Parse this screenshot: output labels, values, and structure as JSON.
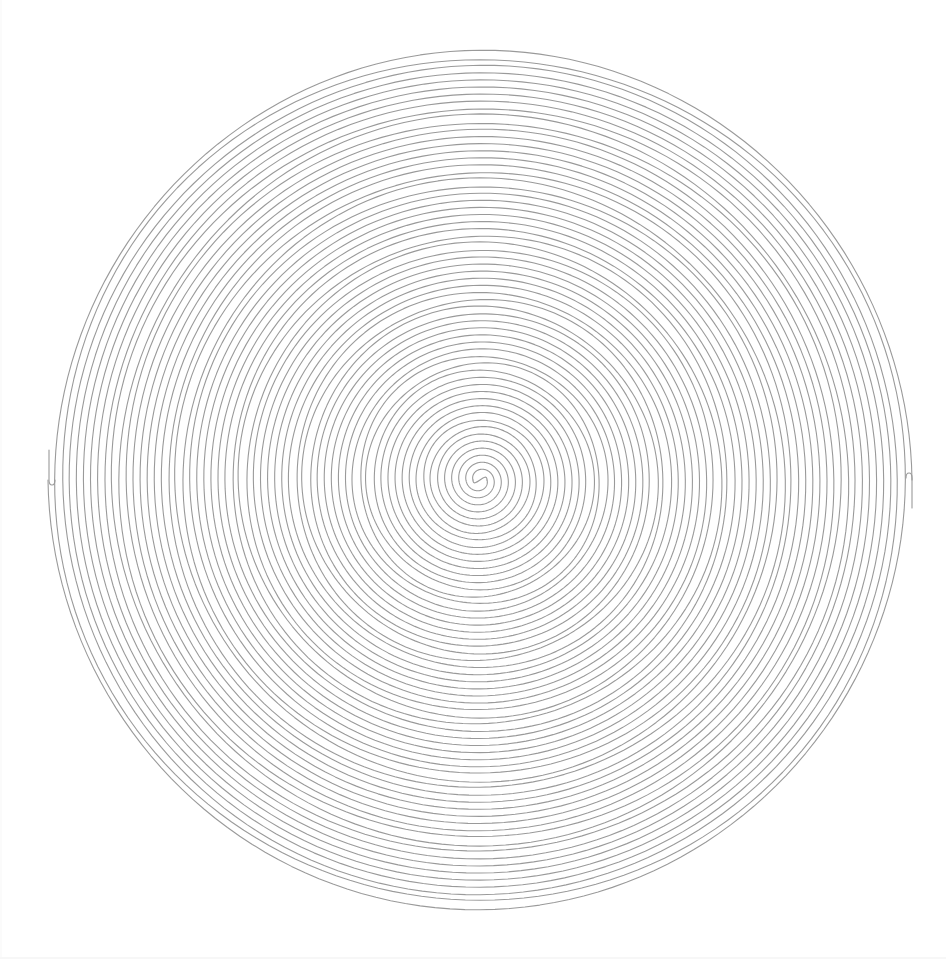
{
  "artwork": {
    "type": "double-spiral",
    "background": "#ffffff",
    "stroke_color": "#9a9a9a",
    "stroke_width": 1.1,
    "center": [
      480,
      480
    ],
    "outer_radius": 432,
    "turns": 30,
    "arm_spacing_px": 14.4,
    "inner_s_radius": 7,
    "arms": 2,
    "wobble_amplitude": 1.4,
    "outer_end_left": [
      49,
      480
    ],
    "outer_end_right": [
      912,
      478
    ]
  }
}
